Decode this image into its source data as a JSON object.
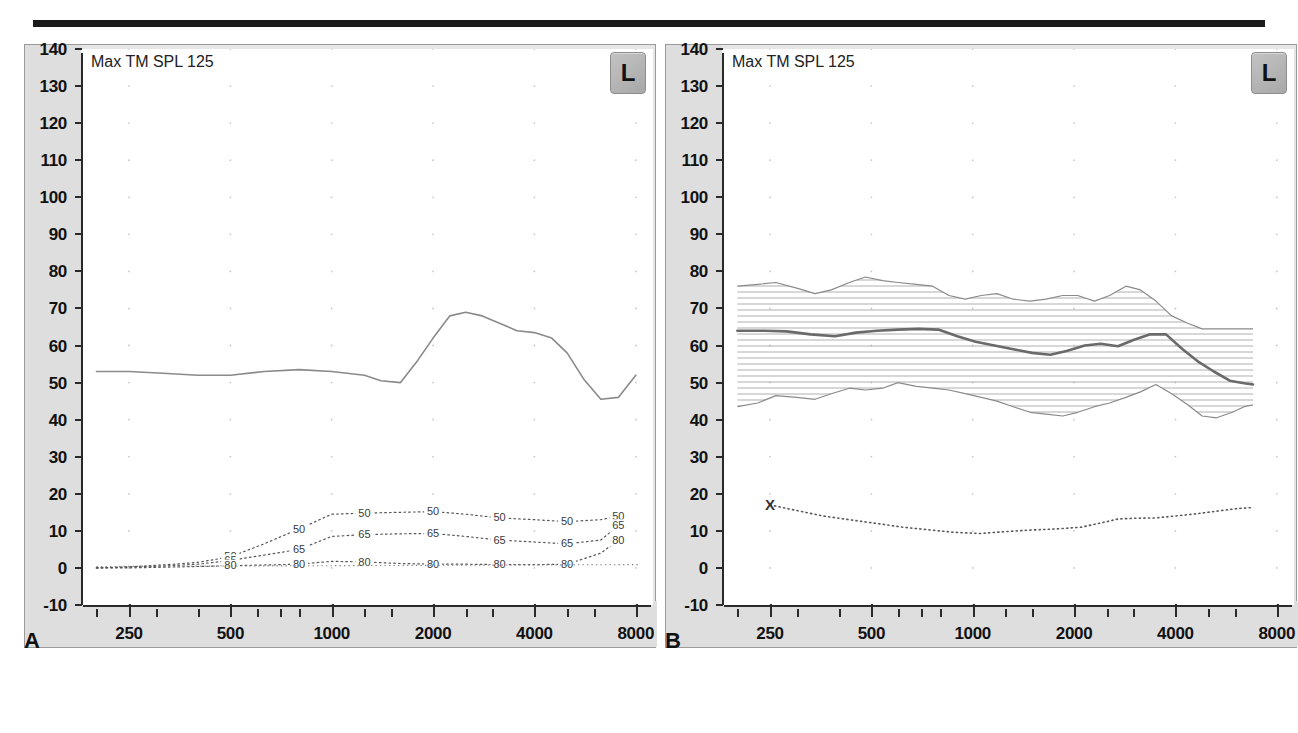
{
  "figure": {
    "caption": "",
    "panels": [
      {
        "letter": "A",
        "title": "Max TM SPL 125",
        "ear_badge": "L",
        "badge_name": "left-ear"
      },
      {
        "letter": "B",
        "title": "Max TM SPL 125",
        "ear_badge": "L",
        "badge_name": "left-ear"
      }
    ]
  },
  "axes": {
    "y_label_values": [
      "140",
      "130",
      "120",
      "110",
      "100",
      "90",
      "80",
      "70",
      "60",
      "50",
      "40",
      "30",
      "20",
      "10",
      "0",
      "-10"
    ],
    "x_label_values": [
      "250",
      "500",
      "1000",
      "2000",
      "4000",
      "8000"
    ],
    "ylim": [
      -10,
      140
    ],
    "xlim_hz": [
      180,
      9000
    ],
    "y_unit": "dB SPL",
    "x_unit": "Hz"
  },
  "colors": {
    "gutter": "#dedede",
    "plot_bg": "#ffffff",
    "axis": "#2a2a2a",
    "curve": "#8a8a8a",
    "curve_bold": "#6a6a6a",
    "hatch": "#9a9a9a",
    "grid_dot": "#c8c8c8",
    "rule": "#1b1b1b"
  },
  "chart_data": [
    {
      "type": "line",
      "panel": "A",
      "title": "Max TM SPL 125",
      "xlabel": "Frequency (Hz)",
      "ylabel": "dB SPL",
      "xlim": [
        180,
        9000
      ],
      "ylim": [
        -10,
        140
      ],
      "xscale": "log",
      "grid": "dots",
      "series": [
        {
          "name": "Max TM SPL",
          "style": "solid",
          "x": [
            200,
            250,
            315,
            400,
            500,
            630,
            800,
            1000,
            1250,
            1400,
            1600,
            1800,
            2000,
            2240,
            2500,
            2800,
            3150,
            3550,
            4000,
            4500,
            5000,
            5600,
            6300,
            7100,
            8000
          ],
          "y": [
            53,
            53,
            52.5,
            52,
            52,
            53,
            53.5,
            53,
            52,
            50.5,
            50,
            56,
            62,
            68,
            69,
            68,
            66,
            64,
            63.5,
            62,
            58,
            51,
            45.5,
            46,
            52
          ]
        },
        {
          "name": "50",
          "style": "dotted",
          "label": "50",
          "x": [
            200,
            250,
            315,
            400,
            500,
            630,
            800,
            1000,
            1250,
            1600,
            2000,
            2500,
            3150,
            4000,
            5000,
            6300,
            7100
          ],
          "y": [
            0,
            0.3,
            0.8,
            1.5,
            3,
            6.5,
            10.5,
            14.5,
            14.8,
            15,
            15.2,
            14.5,
            13.5,
            13,
            12.5,
            13,
            14
          ]
        },
        {
          "name": "65",
          "style": "dotted",
          "label": "65",
          "x": [
            200,
            250,
            315,
            400,
            500,
            630,
            800,
            1000,
            1250,
            1600,
            2000,
            2500,
            3150,
            4000,
            5000,
            6300,
            7100
          ],
          "y": [
            0,
            0.2,
            0.5,
            1,
            2,
            3.5,
            5,
            8.5,
            9,
            9.2,
            9.3,
            8.5,
            7.5,
            7,
            6.5,
            7.5,
            11.5
          ]
        },
        {
          "name": "80",
          "style": "dotted",
          "label": "80",
          "x": [
            200,
            250,
            315,
            400,
            500,
            630,
            800,
            1000,
            1250,
            1600,
            2000,
            2500,
            3150,
            4000,
            5000,
            6300,
            7100
          ],
          "y": [
            0,
            0,
            0.2,
            0.4,
            0.6,
            0.8,
            1.0,
            1.8,
            1.6,
            1.2,
            1.0,
            1.0,
            0.9,
            0.9,
            1.0,
            4.0,
            7.5
          ]
        },
        {
          "name": "baseline",
          "style": "dotted-flat",
          "x": [
            200,
            8200
          ],
          "y": [
            0.4,
            0.9
          ]
        }
      ]
    },
    {
      "type": "area",
      "panel": "B",
      "title": "Max TM SPL 125",
      "xlabel": "Frequency (Hz)",
      "ylabel": "dB SPL",
      "xlim": [
        180,
        9000
      ],
      "ylim": [
        -10,
        140
      ],
      "xscale": "log",
      "grid": "dots",
      "band": {
        "name": "TM SPL range (min/max envelope, hatched)",
        "hatch": "horizontal",
        "x": [
          200,
          230,
          260,
          300,
          340,
          380,
          430,
          480,
          540,
          600,
          680,
          760,
          850,
          950,
          1060,
          1180,
          1320,
          1480,
          1650,
          1850,
          2050,
          2300,
          2550,
          2850,
          3150,
          3500,
          3900,
          4350,
          4800,
          5300,
          5900,
          6400,
          6800
        ],
        "upper": [
          76,
          76.5,
          77,
          75.5,
          74,
          75,
          77,
          78.5,
          77.5,
          77,
          76.5,
          76,
          73.5,
          72.5,
          73.5,
          74,
          72.5,
          72,
          72.5,
          73.5,
          73.5,
          72,
          73.5,
          76,
          75,
          72,
          68,
          66,
          64.5,
          64.5,
          64.5,
          64.5,
          64.5
        ],
        "lower": [
          43.5,
          44.5,
          46.5,
          46,
          45.5,
          47,
          48.5,
          48,
          48.5,
          50,
          49,
          48.5,
          48,
          47,
          46,
          45,
          43.5,
          42,
          41.5,
          41,
          42,
          43.5,
          44.5,
          46,
          47.5,
          49.5,
          47,
          44,
          41,
          40.5,
          42,
          43.5,
          44
        ]
      },
      "series": [
        {
          "name": "Mean TM SPL",
          "style": "solid-bold",
          "x": [
            200,
            240,
            280,
            330,
            390,
            450,
            520,
            600,
            690,
            790,
            900,
            1020,
            1160,
            1320,
            1500,
            1700,
            1900,
            2150,
            2400,
            2700,
            3000,
            3350,
            3750,
            4200,
            4700,
            5200,
            5800,
            6400,
            6800
          ],
          "y": [
            64,
            64,
            63.8,
            63,
            62.5,
            63.5,
            64,
            64.3,
            64.5,
            64.3,
            62.5,
            61,
            60,
            59,
            58,
            57.5,
            58.5,
            60,
            60.5,
            59.8,
            61.5,
            63,
            63,
            59,
            55.5,
            53,
            50.5,
            49.8,
            49.5
          ]
        },
        {
          "name": "Noise floor",
          "style": "dotted",
          "marker": "X",
          "marker_x": 250,
          "marker_y": 17,
          "x": [
            250,
            300,
            360,
            430,
            520,
            620,
            740,
            880,
            1050,
            1250,
            1480,
            1760,
            2100,
            2500,
            2700,
            3000,
            3500,
            4000,
            4600,
            5300,
            6100,
            6800
          ],
          "y": [
            17,
            15.5,
            14,
            13,
            12,
            11,
            10.3,
            9.6,
            9.3,
            9.8,
            10.2,
            10.5,
            11,
            12.5,
            13.2,
            13.4,
            13.5,
            14,
            14.6,
            15.3,
            16,
            16.3
          ]
        }
      ]
    }
  ]
}
